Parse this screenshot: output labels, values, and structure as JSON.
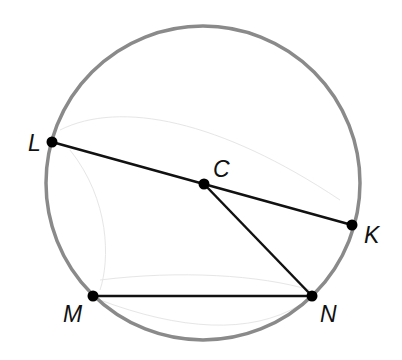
{
  "diagram": {
    "type": "circle-geometry",
    "colors": {
      "circle": "#8a8a8a",
      "segment": "#111111",
      "point": "#000000",
      "faint_sketch": "#e2e2e2"
    },
    "circle": {
      "center_label": "C",
      "cx": 203,
      "cy": 183,
      "r": 157
    },
    "points": [
      {
        "id": "L",
        "label": "L",
        "x": 52,
        "y": 142,
        "lx": 28,
        "ly": 151
      },
      {
        "id": "C",
        "label": "C",
        "x": 204,
        "y": 184,
        "lx": 213,
        "ly": 177
      },
      {
        "id": "K",
        "label": "K",
        "x": 352,
        "y": 225,
        "lx": 364,
        "ly": 243
      },
      {
        "id": "M",
        "label": "M",
        "x": 93,
        "y": 296,
        "lx": 63,
        "ly": 322
      },
      {
        "id": "N",
        "label": "N",
        "x": 312,
        "y": 296,
        "lx": 320,
        "ly": 322
      }
    ],
    "segments": [
      {
        "name": "LK",
        "from": "L",
        "to": "K",
        "note": "diameter through C"
      },
      {
        "name": "CN",
        "from": "C",
        "to": "N",
        "note": "radius"
      },
      {
        "name": "MN",
        "from": "M",
        "to": "N",
        "note": "chord"
      }
    ]
  }
}
